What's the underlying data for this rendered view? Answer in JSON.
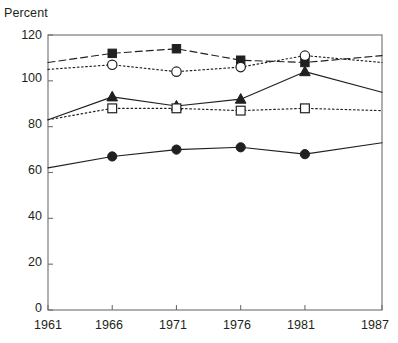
{
  "chart_data": {
    "type": "line",
    "title": "",
    "xlabel": "",
    "ylabel": "Percent",
    "x": [
      1961,
      1966,
      1971,
      1976,
      1981,
      1987
    ],
    "xtick_labels": [
      "1961",
      "1966",
      "1971",
      "1976",
      "1981",
      "1987"
    ],
    "ytick_labels": [
      "0",
      "20",
      "40",
      "60",
      "80",
      "100",
      "120"
    ],
    "yticks": [
      0,
      20,
      40,
      60,
      80,
      100,
      120
    ],
    "ylim": [
      0,
      120
    ],
    "xlim": [
      1961,
      1987
    ],
    "grid": false,
    "legend": "none",
    "series": [
      {
        "name": "series-dashed-filled-square",
        "marker": "filled-square",
        "linestyle": "dashed",
        "values": [
          108,
          112,
          114,
          109,
          108,
          111
        ],
        "markers_at": [
          false,
          true,
          true,
          true,
          true,
          false
        ]
      },
      {
        "name": "series-dotted-open-circle",
        "marker": "open-circle",
        "linestyle": "dotted",
        "values": [
          105,
          107,
          104,
          106,
          111,
          108
        ],
        "markers_at": [
          false,
          true,
          true,
          true,
          true,
          false
        ]
      },
      {
        "name": "series-solid-filled-triangle",
        "marker": "filled-triangle",
        "linestyle": "solid",
        "values": [
          83,
          93,
          89,
          92,
          104,
          95
        ],
        "markers_at": [
          false,
          true,
          true,
          true,
          true,
          false
        ]
      },
      {
        "name": "series-dotted-open-square",
        "marker": "open-square",
        "linestyle": "dotted",
        "values": [
          83,
          88,
          88,
          87,
          88,
          87
        ],
        "markers_at": [
          false,
          true,
          true,
          true,
          true,
          false
        ]
      },
      {
        "name": "series-solid-filled-circle",
        "marker": "filled-circle",
        "linestyle": "solid",
        "values": [
          62,
          67,
          70,
          71,
          68,
          73
        ],
        "markers_at": [
          false,
          true,
          true,
          true,
          true,
          false
        ]
      }
    ],
    "colors": {
      "line": "#231f20",
      "axis": "#6d6e71",
      "background": "#ffffff"
    }
  }
}
